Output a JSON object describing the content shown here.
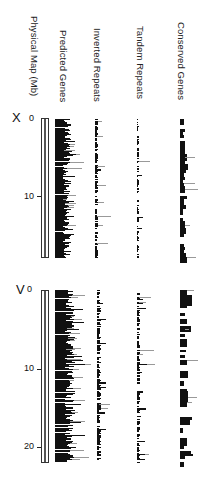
{
  "column_labels": {
    "physical_map": "Physical Map (Mb)",
    "predicted_genes": "Predicted Genes",
    "inverted_repeats": "Inverted Repeats",
    "tandem_repeats": "Tandem Repeats",
    "conserved_genes": "Conserved Genes"
  },
  "chromosomes": [
    {
      "name": "X",
      "length_mb": 17.7,
      "ticks": [
        "0",
        "10"
      ]
    },
    {
      "name": "V",
      "length_mb": 21.0,
      "ticks": [
        "0",
        "10",
        "20"
      ]
    }
  ],
  "colors": {
    "ink": "#111111",
    "faint": "#999999",
    "background": "#ffffff"
  }
}
